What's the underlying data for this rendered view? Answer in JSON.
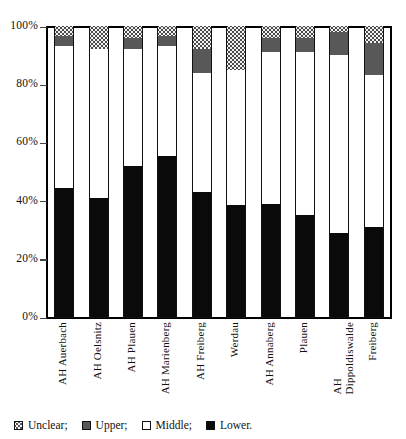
{
  "chart_data": {
    "type": "bar",
    "subtype": "stacked-percentage",
    "title": "",
    "xlabel": "",
    "ylabel": "",
    "ylim": [
      0,
      100
    ],
    "ytick_labels": [
      "0%",
      "20%",
      "40%",
      "60%",
      "80%",
      "100%"
    ],
    "ytick_values": [
      0,
      20,
      40,
      60,
      80,
      100
    ],
    "grid": false,
    "legend_position": "bottom-left",
    "stack_order_bottom_to_top": [
      "Lower",
      "Middle",
      "Upper",
      "Unclear"
    ],
    "categories": [
      "AH Auerbach",
      "AH Oelsnitz",
      "AH Plauen",
      "AH Marienberg",
      "AH Freiberg",
      "Werdau",
      "AH Annaberg",
      "Plauen",
      "AH\nDippoldiswalde",
      "Freiberg"
    ],
    "series": [
      {
        "name": "Lower",
        "color": "#0a0a0a",
        "values": [
          44.5,
          41.0,
          52.0,
          55.5,
          43.0,
          38.5,
          39.0,
          35.0,
          29.0,
          31.0
        ]
      },
      {
        "name": "Middle",
        "color": "#ffffff",
        "values": [
          48.5,
          51.0,
          40.0,
          37.5,
          41.0,
          46.5,
          52.0,
          56.0,
          61.0,
          52.0
        ]
      },
      {
        "name": "Upper",
        "color": "#585858",
        "values": [
          3.5,
          0.0,
          4.0,
          3.5,
          8.0,
          0.0,
          5.0,
          5.0,
          8.0,
          11.0
        ]
      },
      {
        "name": "Unclear",
        "color": "#f0f0f0",
        "values": [
          3.5,
          8.0,
          4.0,
          3.5,
          8.0,
          15.0,
          4.0,
          4.0,
          2.0,
          6.0
        ]
      }
    ]
  },
  "legend": {
    "items": [
      {
        "key": "unclear",
        "label": "Unclear;"
      },
      {
        "key": "upper",
        "label": "Upper;"
      },
      {
        "key": "middle",
        "label": "Middle;"
      },
      {
        "key": "lower",
        "label": "Lower."
      }
    ]
  }
}
